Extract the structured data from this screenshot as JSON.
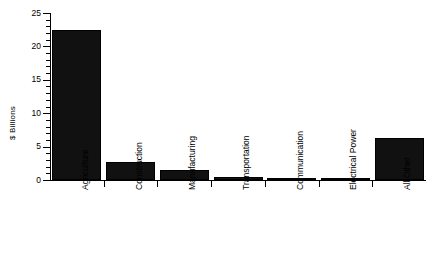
{
  "chart_data": {
    "type": "bar",
    "title": "",
    "subtitle": "",
    "xlabel": "",
    "ylabel": "$ Billions",
    "categories": [
      "Agriculture",
      "Construction",
      "Manufacturing",
      "Transportation",
      "Communication",
      "Electrical Power",
      "All Other"
    ],
    "values": [
      22.4,
      2.7,
      1.5,
      0.4,
      0.15,
      0.1,
      6.3
    ],
    "ylim": [
      0,
      25
    ],
    "ytick_labels": [
      "0",
      "5",
      "10",
      "15",
      "20",
      "25"
    ],
    "ytick_values": [
      0,
      5,
      10,
      15,
      20,
      25
    ],
    "minor_tick_interval": 1,
    "grid": false,
    "legend": null,
    "series": [
      {
        "name": "$ Billions",
        "values": [
          22.4,
          2.7,
          1.5,
          0.4,
          0.15,
          0.1,
          6.3
        ]
      }
    ],
    "colors": {
      "bar_fill": "#111111",
      "bar_edge": "#000000",
      "axis": "#000000",
      "background": "#ffffff"
    }
  }
}
